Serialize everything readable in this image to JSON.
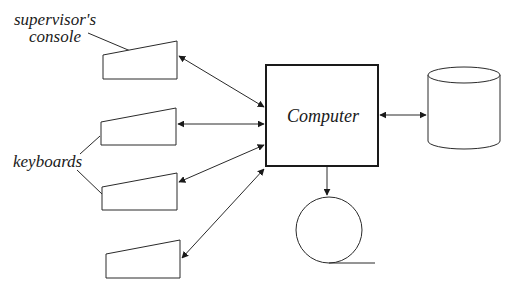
{
  "diagram": {
    "type": "block-diagram",
    "nodes": {
      "computer": {
        "label": "Computer",
        "shape": "rectangle"
      },
      "supervisor_console": {
        "label": "supervisor's console",
        "label_line1": "supervisor's",
        "label_line2": "console",
        "shape": "terminal"
      },
      "keyboard_1": {
        "label": "",
        "shape": "terminal"
      },
      "keyboard_2": {
        "label": "",
        "shape": "terminal"
      },
      "keyboard_3": {
        "label": "",
        "shape": "terminal"
      },
      "disk_storage": {
        "label": "",
        "shape": "cylinder"
      },
      "tape_drive": {
        "label": "",
        "shape": "circle-tape"
      }
    },
    "group_labels": {
      "keyboards": "keyboards"
    },
    "edges": [
      {
        "from": "supervisor_console",
        "to": "computer",
        "direction": "both"
      },
      {
        "from": "keyboard_1",
        "to": "computer",
        "direction": "both"
      },
      {
        "from": "keyboard_2",
        "to": "computer",
        "direction": "both"
      },
      {
        "from": "keyboard_3",
        "to": "computer",
        "direction": "both"
      },
      {
        "from": "computer",
        "to": "disk_storage",
        "direction": "both"
      },
      {
        "from": "computer",
        "to": "tape_drive",
        "direction": "forward"
      }
    ],
    "colors": {
      "stroke": "#2a2a2a",
      "background": "#ffffff",
      "text": "#1a1a1a"
    }
  }
}
